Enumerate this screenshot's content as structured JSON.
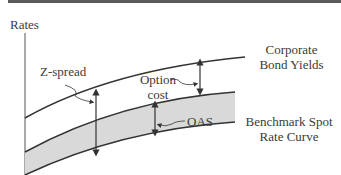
{
  "diagram": {
    "axis_label": "Rates",
    "labels": {
      "z_spread": "Z-spread",
      "option_cost_line1": "Option",
      "option_cost_line2": "cost",
      "oas": "OAS",
      "corporate_line1": "Corporate",
      "corporate_line2": "Bond Yields",
      "benchmark_line1": "Benchmark Spot",
      "benchmark_line2": "Rate Curve"
    },
    "colors": {
      "line": "#333333",
      "band_fill": "#d9d9d9",
      "text": "#3a3a3a",
      "top_rule": "#5a5a5a"
    }
  }
}
